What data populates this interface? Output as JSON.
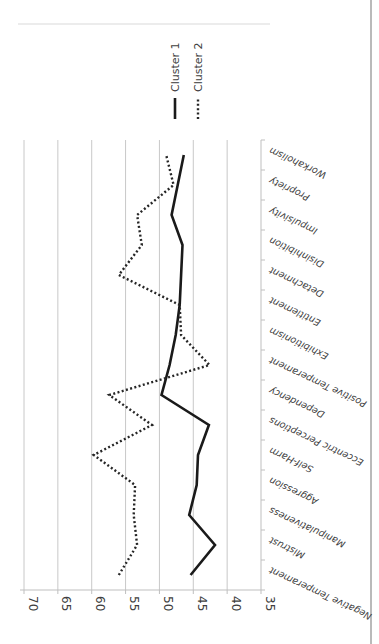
{
  "chart_data": {
    "type": "line",
    "orientation": "rotated-90-clockwise",
    "title": "",
    "xlabel": "",
    "ylabel": "",
    "ylim": [
      35,
      70
    ],
    "yticks": [
      70,
      65,
      60,
      55,
      50,
      45,
      40,
      35
    ],
    "ytick_labels": [
      "70",
      "65",
      "60",
      "55",
      "50",
      "45",
      "40",
      "35"
    ],
    "grid": true,
    "legend_position": "top",
    "categories": [
      "Negative Temperament",
      "Mistrust",
      "Manipulativeness",
      "Aggression",
      "Self-Harm",
      "Eccentric Perceptions",
      "Dependency",
      "Positive Temperament",
      "Exhibitionism",
      "Entitlement",
      "Detachment",
      "Disinhibition",
      "Impulsivity",
      "Propriety",
      "Workaholism"
    ],
    "series": [
      {
        "name": "Cluster 1",
        "style": "solid",
        "values": [
          45.4,
          41.8,
          45.6,
          44.5,
          44.3,
          42.7,
          49.7,
          48.5,
          47.6,
          47.0,
          46.8,
          46.6,
          48.2,
          47.3,
          46.4
        ]
      },
      {
        "name": "Cluster 2",
        "style": "dotted",
        "values": [
          56.0,
          53.3,
          53.8,
          53.6,
          59.7,
          51.1,
          57.4,
          42.6,
          46.8,
          47.0,
          56.0,
          52.6,
          53.3,
          47.9,
          49.0
        ]
      }
    ]
  },
  "legend": {
    "items": [
      {
        "label": "Cluster 1",
        "style": "solid"
      },
      {
        "label": "Cluster 2",
        "style": "dotted"
      }
    ]
  }
}
